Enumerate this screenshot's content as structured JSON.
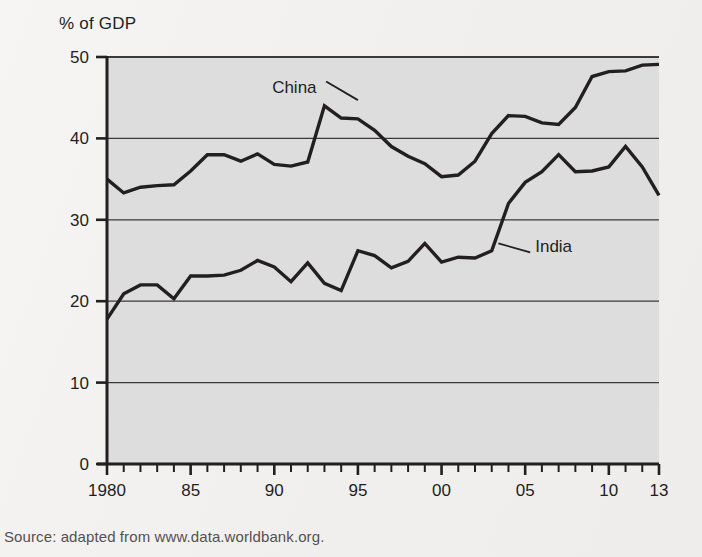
{
  "figure": {
    "y_axis_title": "% of GDP",
    "source_note": "Source: adapted from www.data.worldbank.org.",
    "watermark_line1": "Thinking like an ec",
    "watermark_line2": "A2 Economics"
  },
  "colors": {
    "page_background": "#f4f3f1",
    "plot_background": "#dddddd",
    "axis": "#231f20",
    "gridline": "#3a3a3a",
    "series_line": "#231f20",
    "text": "#231f20",
    "source_text": "#555052"
  },
  "chart_data": {
    "type": "line",
    "title": "",
    "subtitle": "",
    "xlabel": "",
    "ylabel": "% of GDP",
    "ylim": [
      0,
      50
    ],
    "ytick_values": [
      0,
      10,
      20,
      30,
      40,
      50
    ],
    "ytick_labels": [
      "0",
      "10",
      "20",
      "30",
      "40",
      "50"
    ],
    "grid": true,
    "grid_axis": "y",
    "legend_position": "inline-annotation",
    "xlim": [
      1980,
      2013
    ],
    "x": [
      1980,
      1981,
      1982,
      1983,
      1984,
      1985,
      1986,
      1987,
      1988,
      1989,
      1990,
      1991,
      1992,
      1993,
      1994,
      1995,
      1996,
      1997,
      1998,
      1999,
      2000,
      2001,
      2002,
      2003,
      2004,
      2005,
      2006,
      2007,
      2008,
      2009,
      2010,
      2011,
      2012,
      2013
    ],
    "xtick_major_values": [
      1980,
      1985,
      1990,
      1995,
      2000,
      2005,
      2010,
      2013
    ],
    "xtick_major_labels": [
      "1980",
      "85",
      "90",
      "95",
      "00",
      "05",
      "10",
      "13"
    ],
    "series": [
      {
        "name": "China",
        "label_position": {
          "x": 1991.2,
          "y": 45.6
        },
        "values": [
          35.0,
          33.3,
          34.0,
          34.2,
          34.3,
          36.0,
          38.0,
          38.0,
          37.2,
          38.1,
          36.8,
          36.6,
          37.1,
          44.0,
          42.5,
          42.4,
          41.0,
          39.0,
          37.8,
          36.9,
          35.3,
          35.5,
          37.2,
          40.6,
          42.8,
          42.7,
          41.9,
          41.7,
          43.8,
          47.6,
          48.2,
          48.3,
          49.0,
          49.1
        ]
      },
      {
        "name": "India",
        "label_position": {
          "x": 2005.6,
          "y": 26.1
        },
        "values": [
          17.8,
          20.9,
          22.0,
          22.0,
          20.3,
          23.1,
          23.1,
          23.2,
          23.8,
          25.0,
          24.2,
          22.4,
          24.7,
          22.2,
          21.3,
          26.2,
          25.6,
          24.1,
          24.9,
          27.1,
          24.8,
          25.4,
          25.3,
          26.2,
          32.0,
          34.6,
          35.9,
          38.0,
          35.9,
          36.0,
          36.5,
          39.0,
          36.5,
          33.0
        ]
      }
    ],
    "annotations": [
      {
        "text": "China",
        "leader_from": [
          1993.1,
          47.0
        ],
        "leader_to": [
          1995.0,
          44.7
        ]
      },
      {
        "text": "India",
        "leader_from": [
          2005.3,
          26.0
        ],
        "leader_to": [
          2003.4,
          27.1
        ]
      }
    ]
  }
}
